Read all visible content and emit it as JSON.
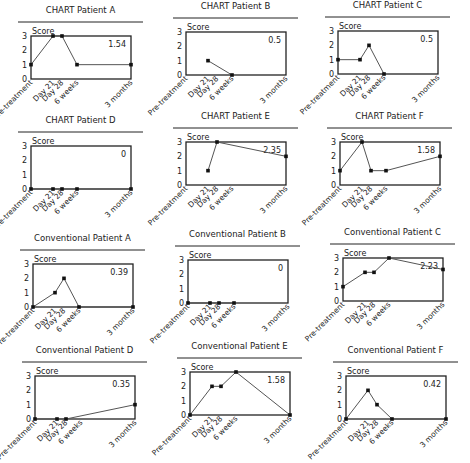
{
  "x_labels": [
    "Pre-treatment",
    "Day 21",
    "Day 28",
    "6 weeks",
    "3 months"
  ],
  "y_ticks": [
    0,
    1,
    2,
    3
  ],
  "y_label": "Score",
  "colors": {
    "line": "#555555",
    "marker": "#111111",
    "axis": "#222222"
  },
  "chart_data": [
    {
      "type": "line",
      "title": "CHART Patient A",
      "annotation": "1.54",
      "ylabel": "Score",
      "ylim": [
        0,
        3
      ],
      "categories": [
        "Pre-treatment",
        "Day 21",
        "Day 28",
        "6 weeks",
        "3 months"
      ],
      "values": [
        1,
        3,
        3,
        1,
        1
      ]
    },
    {
      "type": "line",
      "title": "CHART Patient B",
      "annotation": "0.5",
      "ylabel": "Score",
      "ylim": [
        0,
        3
      ],
      "categories": [
        "Pre-treatment",
        "Day 21",
        "Day 28",
        "6 weeks",
        "3 months"
      ],
      "values": [
        null,
        1,
        null,
        0,
        null
      ]
    },
    {
      "type": "line",
      "title": "CHART Patient C",
      "annotation": "0.5",
      "ylabel": "Score",
      "ylim": [
        0,
        3
      ],
      "categories": [
        "Pre-treatment",
        "Day 21",
        "Day 28",
        "6 weeks",
        "3 months"
      ],
      "values": [
        1,
        1,
        2,
        0,
        null
      ]
    },
    {
      "type": "line",
      "title": "CHART Patient D",
      "annotation": "0",
      "ylabel": "Score",
      "ylim": [
        0,
        3
      ],
      "categories": [
        "Pre-treatment",
        "Day 21",
        "Day 28",
        "6 weeks",
        "3 months"
      ],
      "values": [
        0,
        0,
        0,
        0,
        0
      ]
    },
    {
      "type": "line",
      "title": "CHART Patient E",
      "annotation": "2.35",
      "ylabel": "Score",
      "ylim": [
        0,
        3
      ],
      "categories": [
        "Pre-treatment",
        "Day 21",
        "Day 28",
        "6 weeks",
        "3 months"
      ],
      "values": [
        null,
        1,
        3,
        null,
        2
      ]
    },
    {
      "type": "line",
      "title": "CHART Patient F",
      "annotation": "1.58",
      "ylabel": "Score",
      "ylim": [
        0,
        3
      ],
      "categories": [
        "Pre-treatment",
        "Day 21",
        "Day 28",
        "6 weeks",
        "3 months"
      ],
      "values": [
        1,
        3,
        1,
        1,
        2
      ]
    },
    {
      "type": "line",
      "title": "Conventional Patient A",
      "annotation": "0.39",
      "ylabel": "Score",
      "ylim": [
        0,
        3
      ],
      "categories": [
        "Pre-treatment",
        "Day 21",
        "Day 28",
        "6 weeks",
        "3 months"
      ],
      "values": [
        0,
        1,
        2,
        0,
        0
      ]
    },
    {
      "type": "line",
      "title": "Conventional Patient B",
      "annotation": "0",
      "ylabel": "Score",
      "ylim": [
        0,
        3
      ],
      "categories": [
        "Pre-treatment",
        "Day 21",
        "Day 28",
        "6 weeks",
        "3 months"
      ],
      "values": [
        0,
        0,
        0,
        0,
        null
      ]
    },
    {
      "type": "line",
      "title": "Conventional Patient C",
      "annotation": "2.23",
      "ylabel": "Score",
      "ylim": [
        0,
        3
      ],
      "categories": [
        "Pre-treatment",
        "Day 21",
        "Day 28",
        "6 weeks",
        "3 months"
      ],
      "values": [
        1,
        2,
        2,
        3,
        2.2
      ]
    },
    {
      "type": "line",
      "title": "Conventional Patient D",
      "annotation": "0.35",
      "ylabel": "Score",
      "ylim": [
        0,
        3
      ],
      "categories": [
        "Pre-treatment",
        "Day 21",
        "Day 28",
        "6 weeks",
        "3 months"
      ],
      "values": [
        0,
        0,
        0,
        null,
        1
      ]
    },
    {
      "type": "line",
      "title": "Conventional Patient E",
      "annotation": "1.58",
      "ylabel": "Score",
      "ylim": [
        0,
        3
      ],
      "categories": [
        "Pre-treatment",
        "Day 21",
        "Day 28",
        "6 weeks",
        "3 months"
      ],
      "values": [
        0,
        2,
        2,
        3,
        0
      ]
    },
    {
      "type": "line",
      "title": "Conventional Patient F",
      "annotation": "0.42",
      "ylabel": "Score",
      "ylim": [
        0,
        3
      ],
      "categories": [
        "Pre-treatment",
        "Day 21",
        "Day 28",
        "6 weeks",
        "3 months"
      ],
      "values": [
        0,
        2,
        1,
        0,
        0
      ]
    }
  ]
}
